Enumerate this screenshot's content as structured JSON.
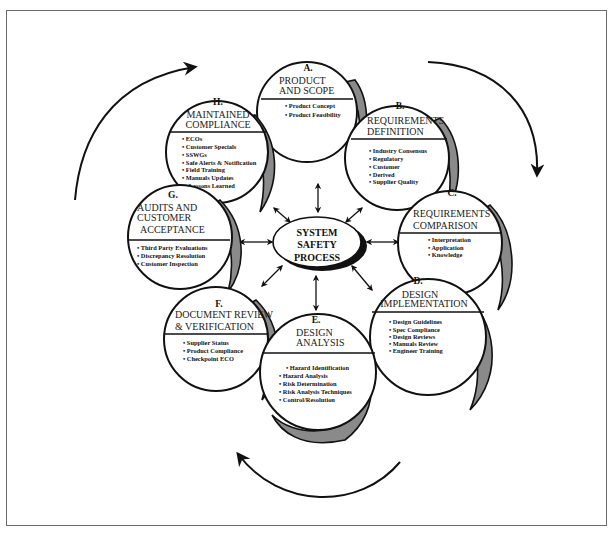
{
  "diagram": {
    "center": {
      "lines": [
        "SYSTEM",
        "SAFETY",
        "PROCESS"
      ]
    },
    "nodes": [
      {
        "id": "A",
        "letter": "A.",
        "title_lines": [
          "PRODUCT",
          "AND SCOPE"
        ],
        "items": [
          "• Product Concept",
          "• Product Feasibility"
        ]
      },
      {
        "id": "B",
        "letter": "B.",
        "title_lines": [
          "REQUIREMENTS",
          "DEFINITION"
        ],
        "items": [
          "• Industry Consensus",
          "• Regulatory",
          "• Customer",
          "• Derived",
          "• Supplier Quality"
        ]
      },
      {
        "id": "C",
        "letter": "C.",
        "title_lines": [
          "REQUIREMENTS",
          "COMPARISON"
        ],
        "items": [
          "• Interpretation",
          "• Application",
          "• Knowledge"
        ]
      },
      {
        "id": "D",
        "letter": "D.",
        "title_lines": [
          "DESIGN",
          "IMPLEMENTATION"
        ],
        "items": [
          "• Design Guidelines",
          "• Spec Compliance",
          "• Design Reviews",
          "• Manuals Review",
          "• Engineer Training"
        ]
      },
      {
        "id": "E",
        "letter": "E.",
        "title_lines": [
          "DESIGN",
          "ANALYSIS"
        ],
        "items": [
          "• Hazard Identification",
          "• Hazard Analysis",
          "• Risk Determination",
          "• Risk Analysis Techniques",
          "• Control/Resolution"
        ]
      },
      {
        "id": "F",
        "letter": "F.",
        "title_lines": [
          "DOCUMENT REVIEW",
          "& VERIFICATION"
        ],
        "items": [
          "• Supplier Status",
          "• Product Compliance",
          "• Checkpoint ECO"
        ]
      },
      {
        "id": "G",
        "letter": "G.",
        "title_lines": [
          "AUDITS AND",
          "CUSTOMER",
          "ACCEPTANCE"
        ],
        "items": [
          "• Third Party Evaluations",
          "• Discrepancy Resolution",
          "• Customer Inspection"
        ]
      },
      {
        "id": "H",
        "letter": "H.",
        "title_lines": [
          "MAINTAINED",
          "COMPLIANCE"
        ],
        "items": [
          "• ECOs",
          "• Customer Specials",
          "• SSWGs",
          "• Safe Alerts & Notification",
          "• Field Training",
          "• Manuals Updates",
          "• Lessons Learned"
        ]
      }
    ],
    "colors": {
      "stroke": "#111111",
      "shadow": "#8a8a8a",
      "background": "#ffffff",
      "frame": "#6a6a6a"
    }
  }
}
